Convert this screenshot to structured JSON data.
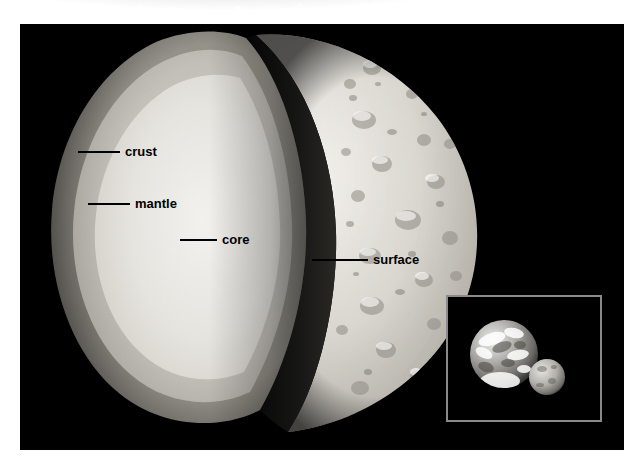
{
  "figure": {
    "background_color": "#ffffff",
    "panel_color": "#000000",
    "border_style": "starfield"
  },
  "planet": {
    "name": "planet-cutaway",
    "cutaway_layers": [
      {
        "id": "core",
        "label": "core",
        "color": "#e9e7e2"
      },
      {
        "id": "mantle",
        "label": "mantle",
        "color": "#c6c4bf"
      },
      {
        "id": "crust",
        "label": "crust",
        "color": "#9a9894"
      }
    ],
    "surface_label": "surface"
  },
  "callouts": [
    {
      "id": "crust",
      "label": "crust",
      "x": 58,
      "y": 145,
      "leader_length": 42
    },
    {
      "id": "mantle",
      "label": "mantle",
      "x": 68,
      "y": 197,
      "leader_length": 42
    },
    {
      "id": "core",
      "label": "core",
      "x": 160,
      "y": 233,
      "leader_length": 37
    },
    {
      "id": "surface",
      "label": "surface",
      "x": 292,
      "y": 253,
      "leader_length": 56
    }
  ],
  "inset": {
    "name": "size-comparison-inset",
    "border_color": "#8a8a8a",
    "background_color": "#000000",
    "bodies": [
      {
        "id": "earth",
        "role": "large-planet"
      },
      {
        "id": "planet",
        "role": "small-planet"
      }
    ]
  },
  "colors": {
    "panel": "#000000",
    "label_text": "#000000",
    "leader_line": "#000000",
    "inset_border": "#8a8a8a",
    "page": "#ffffff"
  }
}
